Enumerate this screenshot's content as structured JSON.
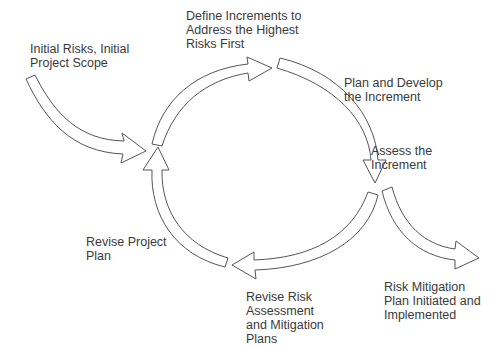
{
  "diagram": {
    "type": "cycle",
    "labels": {
      "entry": [
        "Initial Risks, Initial",
        "Project Scope"
      ],
      "define": [
        "Define Increments to",
        "Address the Highest",
        "Risks First"
      ],
      "plan_develop": [
        "Plan and Develop",
        "the Increment"
      ],
      "assess": [
        "Assess the",
        "Increment"
      ],
      "exit": [
        "Risk Mitigation",
        "Plan Initiated and",
        "Implemented"
      ],
      "revise_risk": [
        "Revise Risk",
        "Assessment",
        "and Mitigation",
        "Plans"
      ],
      "revise_plan": [
        "Revise Project",
        "Plan"
      ]
    },
    "colors": {
      "stroke": "#555555",
      "fill": "#ffffff",
      "text": "#3a3a3a"
    }
  }
}
